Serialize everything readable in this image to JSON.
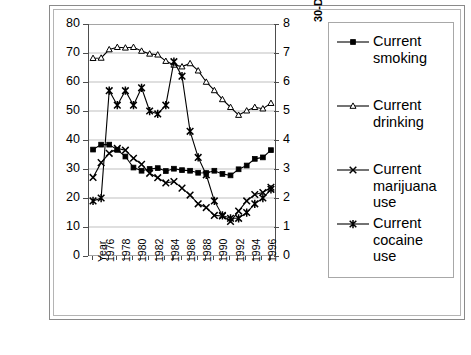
{
  "chart_data": {
    "type": "line",
    "title": "",
    "xlabel": "Year",
    "ylabel": "30-Day Prevalence of Alcohol, Tobacco, and Marijuana Use (%)",
    "y2label": "30-Day Prevalence of Cocaine Use (%)",
    "ylim": [
      0,
      80
    ],
    "y2lim": [
      0,
      8
    ],
    "yticks": [
      0,
      10,
      20,
      30,
      40,
      50,
      60,
      70,
      80
    ],
    "y2ticks": [
      0,
      1,
      2,
      3,
      4,
      5,
      6,
      7,
      8
    ],
    "grid": true,
    "legend_position": "right",
    "x": [
      1975,
      1976,
      1977,
      1978,
      1979,
      1980,
      1981,
      1982,
      1983,
      1984,
      1985,
      1986,
      1987,
      1988,
      1989,
      1990,
      1991,
      1992,
      1993,
      1994,
      1995,
      1996,
      1997
    ],
    "xtick_labels": [
      "Year",
      "1976",
      "1978",
      "1980",
      "1982",
      "1984",
      "1986",
      "1988",
      "1990",
      "1992",
      "1994",
      "1996"
    ],
    "series": [
      {
        "name": "Current smoking",
        "marker": "filled-square",
        "axis": "left",
        "values": [
          36.7,
          38.4,
          38.4,
          36.6,
          34.3,
          30.5,
          29.4,
          30.0,
          30.3,
          29.3,
          30.1,
          29.6,
          29.4,
          28.7,
          28.6,
          29.4,
          28.3,
          27.8,
          29.9,
          31.2,
          33.5,
          34.0,
          36.5
        ]
      },
      {
        "name": "Current drinking",
        "marker": "open-triangle",
        "axis": "left",
        "values": [
          68.2,
          68.3,
          71.2,
          72.0,
          71.8,
          72.0,
          70.7,
          69.7,
          69.4,
          67.2,
          65.9,
          65.3,
          66.4,
          63.9,
          60.0,
          57.1,
          54.0,
          51.3,
          48.6,
          50.1,
          51.3,
          50.8,
          52.7
        ]
      },
      {
        "name": "Current marijuana use",
        "marker": "x-cross",
        "axis": "left",
        "values": [
          27.1,
          32.2,
          35.4,
          37.1,
          36.5,
          33.7,
          31.6,
          28.5,
          27.0,
          25.2,
          25.7,
          23.4,
          21.0,
          18.0,
          16.7,
          14.0,
          13.8,
          11.9,
          15.5,
          19.0,
          21.2,
          21.9,
          23.7
        ]
      },
      {
        "name": "Current cocaine use",
        "marker": "star-cross",
        "axis": "right",
        "values": [
          1.9,
          2.0,
          5.7,
          5.2,
          5.7,
          5.2,
          5.8,
          5.0,
          4.9,
          5.2,
          6.7,
          6.2,
          4.3,
          3.4,
          2.8,
          1.9,
          1.4,
          1.3,
          1.3,
          1.5,
          1.8,
          2.0,
          2.3
        ]
      }
    ]
  },
  "legend": {
    "items": [
      {
        "label_line1": "Current",
        "label_line2": "smoking",
        "marker": "filled-square"
      },
      {
        "label_line1": "Current",
        "label_line2": "drinking",
        "marker": "open-triangle"
      },
      {
        "label_line1": "Current",
        "label_line2": "marijuana",
        "label_line3": "use",
        "marker": "x-cross"
      },
      {
        "label_line1": "Current",
        "label_line2": "cocaine",
        "label_line3": "use",
        "marker": "star-cross"
      }
    ]
  },
  "axes": {
    "left_title": "30-Day Prevalence of Alcohol, Tobacco, and Marijuana Use (%)",
    "right_title": "30-Day Prevalence of Cocaine Use (%)",
    "left_ticks": [
      "80",
      "70",
      "60",
      "50",
      "40",
      "30",
      "20",
      "10",
      "0"
    ],
    "right_ticks": [
      "8",
      "7",
      "6",
      "5",
      "4",
      "3",
      "2",
      "1",
      "0"
    ],
    "x_ticks": [
      "Year",
      "1976",
      "1978",
      "1980",
      "1982",
      "1984",
      "1986",
      "1988",
      "1990",
      "1992",
      "1994",
      "1996"
    ]
  },
  "colors": {
    "line": "#000000",
    "grid": "#bfbfbf",
    "axis": "#4d4d4d",
    "frame": "#8a8a8a",
    "background": "#ffffff"
  }
}
